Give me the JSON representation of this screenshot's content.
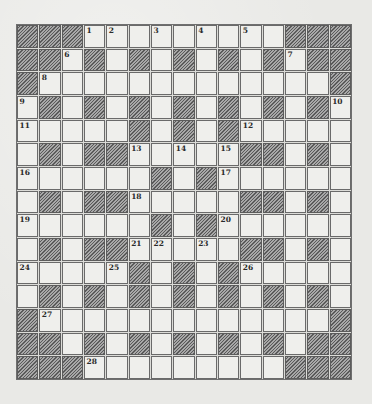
{
  "puzzle": {
    "size": 15,
    "grid": [
      "###.........###",
      "##.#.#.#.#.#.##",
      "#.............#",
      ".#.#.#.#.#.#.#.",
      ".....#.#.#.....",
      ".#.##.....##.#.",
      "......#.#......",
      ".#.##.....##.#.",
      "......#.#......",
      ".#.##.....##.#.",
      ".....#.#.#.....",
      ".#.#.#.#.#.#.#.",
      "#.............#",
      "##.#.#.#.#.#.##",
      "###.........###"
    ],
    "numbers": [
      {
        "row": 0,
        "col": 3,
        "num": "1"
      },
      {
        "row": 0,
        "col": 4,
        "num": "2"
      },
      {
        "row": 0,
        "col": 6,
        "num": "3"
      },
      {
        "row": 0,
        "col": 8,
        "num": "4"
      },
      {
        "row": 0,
        "col": 10,
        "num": "5"
      },
      {
        "row": 1,
        "col": 2,
        "num": "6"
      },
      {
        "row": 1,
        "col": 12,
        "num": "7"
      },
      {
        "row": 2,
        "col": 1,
        "num": "8"
      },
      {
        "row": 3,
        "col": 0,
        "num": "9"
      },
      {
        "row": 3,
        "col": 14,
        "num": "10"
      },
      {
        "row": 4,
        "col": 0,
        "num": "11"
      },
      {
        "row": 4,
        "col": 10,
        "num": "12"
      },
      {
        "row": 5,
        "col": 5,
        "num": "13"
      },
      {
        "row": 5,
        "col": 7,
        "num": "14"
      },
      {
        "row": 5,
        "col": 9,
        "num": "15"
      },
      {
        "row": 6,
        "col": 0,
        "num": "16"
      },
      {
        "row": 6,
        "col": 9,
        "num": "17"
      },
      {
        "row": 7,
        "col": 5,
        "num": "18"
      },
      {
        "row": 8,
        "col": 0,
        "num": "19"
      },
      {
        "row": 8,
        "col": 9,
        "num": "20"
      },
      {
        "row": 9,
        "col": 5,
        "num": "21"
      },
      {
        "row": 9,
        "col": 6,
        "num": "22"
      },
      {
        "row": 9,
        "col": 8,
        "num": "23"
      },
      {
        "row": 10,
        "col": 0,
        "num": "24"
      },
      {
        "row": 10,
        "col": 4,
        "num": "25"
      },
      {
        "row": 10,
        "col": 10,
        "num": "26"
      },
      {
        "row": 12,
        "col": 1,
        "num": "27"
      },
      {
        "row": 14,
        "col": 3,
        "num": "28"
      }
    ],
    "colors": {
      "paper": "#e9e9e6",
      "cell_fill": "#efefec",
      "cell_border": "#6a6a6a",
      "block_dark": "#5a5a5a",
      "block_light": "#a8a8a8",
      "number_text": "#2a2a2a"
    }
  }
}
